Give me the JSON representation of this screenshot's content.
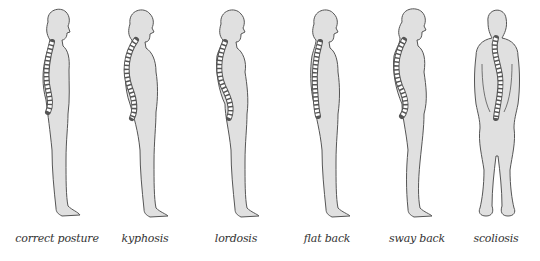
{
  "figure": {
    "type": "illustration",
    "colors": {
      "body_fill": "#e0e0e0",
      "outline": "#555555",
      "spine_fill": "#ffffff",
      "background": "#ffffff"
    },
    "items": [
      {
        "label": "correct posture",
        "view": "side"
      },
      {
        "label": "kyphosis",
        "view": "side"
      },
      {
        "label": "lordosis",
        "view": "side"
      },
      {
        "label": "flat back",
        "view": "side"
      },
      {
        "label": "sway back",
        "view": "side"
      },
      {
        "label": "scoliosis",
        "view": "back"
      }
    ]
  }
}
